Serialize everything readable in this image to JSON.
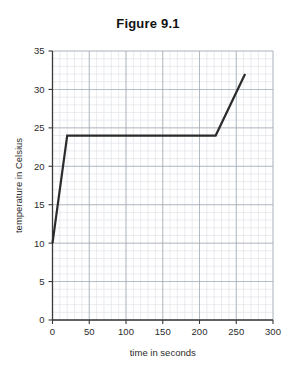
{
  "figure": {
    "title": "Figure 9.1"
  },
  "chart_data": {
    "type": "line",
    "title": "Figure 9.1",
    "xlabel": "time in seconds",
    "ylabel": "temperature in Celsius",
    "xlim": [
      0,
      300
    ],
    "ylim": [
      0,
      35
    ],
    "x_ticks": [
      0,
      50,
      100,
      150,
      200,
      250,
      300
    ],
    "x_tick_labels": [
      "0",
      "50",
      "100",
      "150",
      "200",
      "250",
      "300"
    ],
    "y_ticks": [
      0,
      5,
      10,
      15,
      20,
      25,
      30,
      35
    ],
    "y_tick_labels": [
      "0",
      "5",
      "10",
      "15",
      "20",
      "25",
      "30",
      "35"
    ],
    "x_minor_step": 10,
    "y_minor_step": 1,
    "grid": true,
    "grid_major_color": "#9aa3ad",
    "grid_minor_color": "#dfe3e8",
    "legend": null,
    "series": [
      {
        "name": "temperature",
        "color": "#2b2b2b",
        "line_width": 2.2,
        "points": [
          {
            "x": 0,
            "y": 10
          },
          {
            "x": 20,
            "y": 24
          },
          {
            "x": 222,
            "y": 24
          },
          {
            "x": 262,
            "y": 32
          }
        ]
      }
    ]
  }
}
